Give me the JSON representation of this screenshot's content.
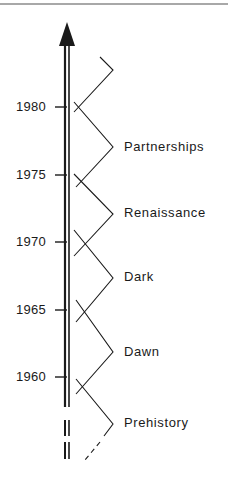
{
  "diagram": {
    "type": "timeline",
    "axis": {
      "direction": "up",
      "style": "double-line with arrowhead",
      "broken_bottom": true
    },
    "years": [
      {
        "label": "1980",
        "y": 107
      },
      {
        "label": "1975",
        "y": 175
      },
      {
        "label": "1970",
        "y": 242
      },
      {
        "label": "1965",
        "y": 310
      },
      {
        "label": "1960",
        "y": 377
      }
    ],
    "eras": [
      {
        "label": "Partnerships",
        "y": 148
      },
      {
        "label": "Renaissance",
        "y": 214
      },
      {
        "label": "Dark",
        "y": 278
      },
      {
        "label": "Dawn",
        "y": 352
      },
      {
        "label": "Prehistory",
        "y": 424
      }
    ],
    "colors": {
      "ink": "#1a1a1a",
      "rule": "#a8a8a8",
      "background": "#ffffff"
    }
  }
}
